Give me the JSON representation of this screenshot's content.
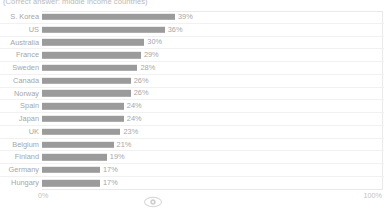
{
  "chart_data": {
    "type": "bar",
    "orientation": "horizontal",
    "title": "",
    "subtitle": "(Correct answer: middle income countries)",
    "xlabel": "",
    "ylabel": "",
    "xlim": [
      0,
      100
    ],
    "x_tick_labels": [
      "0%",
      "100%"
    ],
    "grid": false,
    "legend": "none",
    "bar_color": "#9b9b9b",
    "value_suffix": "%",
    "categories": [
      "S. Korea",
      "US",
      "Australia",
      "France",
      "Sweden",
      "Canada",
      "Norway",
      "Spain",
      "Japan",
      "UK",
      "Belgium",
      "Finland",
      "Germany",
      "Hungary"
    ],
    "values": [
      39,
      36,
      30,
      29,
      28,
      26,
      26,
      24,
      24,
      23,
      21,
      19,
      17,
      17
    ],
    "value_labels": [
      "39%",
      "36%",
      "30%",
      "29%",
      "28%",
      "26%",
      "26%",
      "24%",
      "24%",
      "23%",
      "21%",
      "19%",
      "17%",
      "17%"
    ]
  },
  "axis": {
    "min_label": "0%",
    "max_label": "100%"
  },
  "footer": {
    "icon": "eye-icon"
  }
}
